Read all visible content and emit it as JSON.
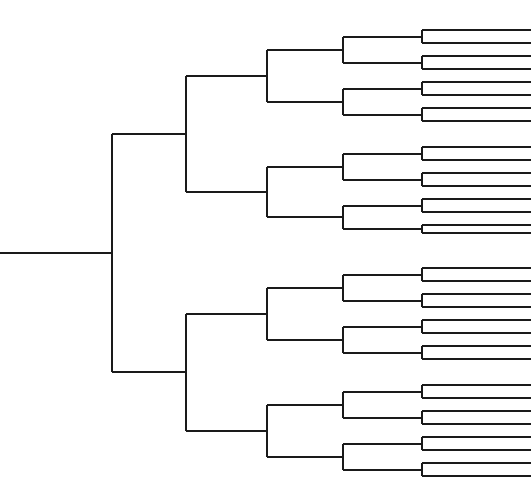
{
  "document": {
    "title": "Dendrogram",
    "type": "hierarchical-cluster-tree",
    "description": "Rectangular binary dendrogram with a left-hand root stem branching rightward through five bifurcation levels into 32 leaf tips clipped at the right edge of the canvas.",
    "background_color": "#ffffff",
    "line_color": "#1a1a1a",
    "line_width": 2
  },
  "canvas": {
    "width": 531,
    "height": 479
  },
  "chart_data": {
    "type": "dendrogram",
    "title": "",
    "orientation": "left-to-right",
    "leaf_count": 32,
    "levels": 5,
    "grid": false,
    "legend": null,
    "xlabel": "",
    "ylabel": "",
    "geometry": {
      "root_stem_x_start": 0,
      "root_stem_x_end": 112,
      "root_y": 243.5,
      "node_x_by_depth": [
        112,
        186,
        267,
        343,
        422
      ],
      "leaf_x_end": 531,
      "first_leaf_y": 30,
      "leaf_spacing": 13.55,
      "half_gap_extra": 10
    },
    "leaf_y_positions": [
      30.0,
      43.0,
      56.0,
      69.0,
      82.0,
      95.0,
      108.0,
      121.0,
      147.0,
      160.0,
      173.0,
      186.0,
      199.0,
      212.0,
      225.0,
      233.0,
      268.0,
      281.0,
      294.0,
      307.0,
      320.0,
      333.0,
      346.0,
      359.0,
      385.0,
      398.0,
      411.0,
      424.0,
      437.0,
      450.0,
      463.0,
      476.0
    ],
    "nodes_by_depth": {
      "depth_0_root": [
        {
          "x": 112,
          "y_top": 131,
          "y_bottom": 357,
          "stem_y": 243.5
        }
      ],
      "depth_1": [
        {
          "x": 186,
          "y_top": 80,
          "y_bottom": 181,
          "stem_y": 131
        },
        {
          "x": 186,
          "y_top": 305,
          "y_bottom": 407,
          "stem_y": 357
        }
      ],
      "depth_2": [
        {
          "x": 267,
          "y_top": 55,
          "y_bottom": 106,
          "stem_y": 80
        },
        {
          "x": 267,
          "y_top": 156,
          "y_bottom": 207,
          "stem_y": 181
        },
        {
          "x": 267,
          "y_top": 280,
          "y_bottom": 331,
          "stem_y": 305
        },
        {
          "x": 267,
          "y_top": 382,
          "y_bottom": 433,
          "stem_y": 407
        }
      ],
      "depth_3": [
        {
          "x": 343,
          "y_top": 42,
          "y_bottom": 68,
          "stem_y": 55
        },
        {
          "x": 343,
          "y_top": 93,
          "y_bottom": 119,
          "stem_y": 106
        },
        {
          "x": 343,
          "y_top": 143,
          "y_bottom": 169,
          "stem_y": 156
        },
        {
          "x": 343,
          "y_top": 194,
          "y_bottom": 220,
          "stem_y": 207
        },
        {
          "x": 343,
          "y_top": 267,
          "y_bottom": 293,
          "stem_y": 280
        },
        {
          "x": 343,
          "y_top": 318,
          "y_bottom": 344,
          "stem_y": 331
        },
        {
          "x": 343,
          "y_top": 369,
          "y_bottom": 395,
          "stem_y": 382
        },
        {
          "x": 343,
          "y_top": 420,
          "y_bottom": 446,
          "stem_y": 433
        }
      ],
      "depth_4": [
        {
          "x": 422,
          "y_top": 30,
          "y_bottom": 43,
          "stem_y": 42
        },
        {
          "x": 422,
          "y_top": 56,
          "y_bottom": 69,
          "stem_y": 68
        },
        {
          "x": 422,
          "y_top": 82,
          "y_bottom": 95,
          "stem_y": 93
        },
        {
          "x": 422,
          "y_top": 108,
          "y_bottom": 121,
          "stem_y": 119
        },
        {
          "x": 422,
          "y_top": 147,
          "y_bottom": 160,
          "stem_y": 143
        },
        {
          "x": 422,
          "y_top": 173,
          "y_bottom": 186,
          "stem_y": 169
        },
        {
          "x": 422,
          "y_top": 199,
          "y_bottom": 212,
          "stem_y": 194
        },
        {
          "x": 422,
          "y_top": 225,
          "y_bottom": 238,
          "stem_y": 220
        },
        {
          "x": 422,
          "y_top": 255,
          "y_bottom": 268,
          "stem_y": 267
        },
        {
          "x": 422,
          "y_top": 281,
          "y_bottom": 294,
          "stem_y": 293
        },
        {
          "x": 422,
          "y_top": 307,
          "y_bottom": 320,
          "stem_y": 318
        },
        {
          "x": 422,
          "y_top": 333,
          "y_bottom": 346,
          "stem_y": 344
        },
        {
          "x": 422,
          "y_top": 372,
          "y_bottom": 385,
          "stem_y": 369
        },
        {
          "x": 422,
          "y_top": 398,
          "y_bottom": 411,
          "stem_y": 395
        },
        {
          "x": 422,
          "y_top": 424,
          "y_bottom": 437,
          "stem_y": 420
        },
        {
          "x": 422,
          "y_top": 450,
          "y_bottom": 463,
          "stem_y": 446
        }
      ]
    }
  }
}
